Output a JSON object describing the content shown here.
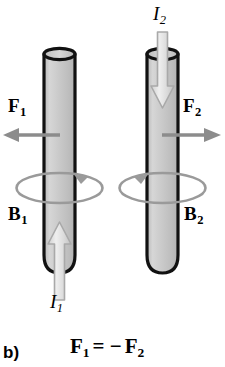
{
  "figure": {
    "panel_label": "b)",
    "equation": {
      "lhs_symbol": "F",
      "lhs_sub": "1",
      "relation": "= −",
      "rhs_symbol": "F",
      "rhs_sub": "2",
      "full_text": "F1 = −F2"
    },
    "background_color": "#ffffff",
    "ink_color": "#000000",
    "arrow_gray": "#8c8c8c",
    "cylinder_fill": "#c9c9c9",
    "cylinder_outline": "#111111",
    "current_arrow_fill": "#e0e0e0"
  },
  "labels": {
    "force_left": {
      "symbol": "F",
      "subscript": "1"
    },
    "force_right": {
      "symbol": "F",
      "subscript": "2"
    },
    "field_left": {
      "symbol": "B",
      "subscript": "1"
    },
    "field_right": {
      "symbol": "B",
      "subscript": "2"
    },
    "current_left": {
      "symbol": "I",
      "subscript": "1"
    },
    "current_right": {
      "symbol": "I",
      "subscript": "2"
    }
  },
  "diagram": {
    "wires": [
      {
        "name": "left-wire",
        "current_direction": "up",
        "force_direction": "left",
        "field_circulation": "counterclockwise-viewed-from-top"
      },
      {
        "name": "right-wire",
        "current_direction": "down",
        "force_direction": "right",
        "field_circulation": "clockwise-viewed-from-top"
      }
    ]
  },
  "icons": {
    "force_arrow_left": "arrow-left-icon",
    "force_arrow_right": "arrow-right-icon",
    "current_arrow_up": "arrow-up-icon",
    "current_arrow_down": "arrow-down-icon",
    "field_loop": "circular-arrow-icon"
  }
}
